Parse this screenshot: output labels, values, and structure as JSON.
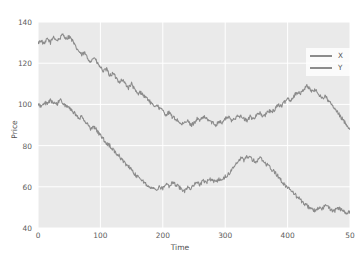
{
  "chart_data": {
    "type": "line",
    "title": "",
    "xlabel": "Time",
    "ylabel": "Price",
    "xlim": [
      0,
      500
    ],
    "ylim": [
      40,
      140
    ],
    "xticks": [
      "0",
      "100",
      "200",
      "300",
      "400",
      "50"
    ],
    "xtick_values": [
      0,
      100,
      200,
      300,
      400,
      500
    ],
    "yticks": [
      "40",
      "60",
      "80",
      "100",
      "120",
      "140"
    ],
    "ytick_values": [
      40,
      60,
      80,
      100,
      120,
      140
    ],
    "grid": true,
    "grid_color": "#ffffff",
    "plot_background": "#eaeaea",
    "legend_position": "upper right",
    "series": [
      {
        "name": "X",
        "color": "#8b8b8b",
        "x": [
          0,
          5,
          10,
          15,
          20,
          25,
          30,
          35,
          40,
          45,
          50,
          55,
          60,
          65,
          70,
          75,
          80,
          85,
          90,
          95,
          100,
          105,
          110,
          115,
          120,
          125,
          130,
          135,
          140,
          145,
          150,
          155,
          160,
          165,
          170,
          175,
          180,
          185,
          190,
          195,
          200,
          205,
          210,
          215,
          220,
          225,
          230,
          235,
          240,
          245,
          250,
          255,
          260,
          265,
          270,
          275,
          280,
          285,
          290,
          295,
          300,
          305,
          310,
          315,
          320,
          325,
          330,
          335,
          340,
          345,
          350,
          355,
          360,
          365,
          370,
          375,
          380,
          385,
          390,
          395,
          400,
          405,
          410,
          415,
          420,
          425,
          430,
          435,
          440,
          445,
          450,
          455,
          460,
          465,
          470,
          475,
          480,
          485,
          490,
          495,
          500
        ],
        "values": [
          130,
          131,
          129,
          132,
          130,
          133,
          131,
          132,
          134,
          132,
          133,
          131,
          128,
          126,
          124,
          125,
          122,
          121,
          123,
          120,
          118,
          116,
          117,
          114,
          115,
          113,
          111,
          112,
          110,
          108,
          110,
          107,
          105,
          106,
          104,
          103,
          101,
          99,
          100,
          98,
          97,
          95,
          96,
          94,
          93,
          92,
          90,
          91,
          92,
          90,
          91,
          93,
          92,
          94,
          93,
          92,
          91,
          90,
          92,
          91,
          93,
          94,
          92,
          93,
          95,
          94,
          93,
          92,
          94,
          93,
          95,
          96,
          94,
          95,
          97,
          96,
          98,
          100,
          99,
          101,
          103,
          102,
          104,
          106,
          105,
          107,
          109,
          108,
          106,
          107,
          105,
          103,
          104,
          102,
          100,
          98,
          96,
          94,
          92,
          90,
          88
        ]
      },
      {
        "name": "Y",
        "color": "#8b8b8b",
        "x": [
          0,
          5,
          10,
          15,
          20,
          25,
          30,
          35,
          40,
          45,
          50,
          55,
          60,
          65,
          70,
          75,
          80,
          85,
          90,
          95,
          100,
          105,
          110,
          115,
          120,
          125,
          130,
          135,
          140,
          145,
          150,
          155,
          160,
          165,
          170,
          175,
          180,
          185,
          190,
          195,
          200,
          205,
          210,
          215,
          220,
          225,
          230,
          235,
          240,
          245,
          250,
          255,
          260,
          265,
          270,
          275,
          280,
          285,
          290,
          295,
          300,
          305,
          310,
          315,
          320,
          325,
          330,
          335,
          340,
          345,
          350,
          355,
          360,
          365,
          370,
          375,
          380,
          385,
          390,
          395,
          400,
          405,
          410,
          415,
          420,
          425,
          430,
          435,
          440,
          445,
          450,
          455,
          460,
          465,
          470,
          475,
          480,
          485,
          490,
          495,
          500
        ],
        "values": [
          100,
          99,
          101,
          100,
          102,
          101,
          100,
          102,
          101,
          99,
          98,
          97,
          95,
          93,
          94,
          92,
          90,
          88,
          89,
          87,
          85,
          83,
          81,
          80,
          78,
          76,
          75,
          73,
          71,
          70,
          68,
          66,
          65,
          64,
          62,
          61,
          60,
          59,
          58,
          60,
          59,
          61,
          60,
          62,
          61,
          60,
          59,
          58,
          60,
          59,
          61,
          62,
          61,
          63,
          62,
          64,
          63,
          62,
          64,
          63,
          65,
          66,
          68,
          70,
          72,
          74,
          73,
          75,
          74,
          73,
          72,
          74,
          73,
          71,
          70,
          68,
          67,
          65,
          63,
          61,
          60,
          58,
          57,
          55,
          54,
          52,
          51,
          50,
          49,
          48,
          50,
          49,
          51,
          50,
          49,
          48,
          50,
          49,
          48,
          47,
          48
        ]
      }
    ]
  },
  "legend": {
    "items": [
      {
        "label": "X"
      },
      {
        "label": "Y"
      }
    ]
  },
  "caption": {
    "text": ""
  }
}
